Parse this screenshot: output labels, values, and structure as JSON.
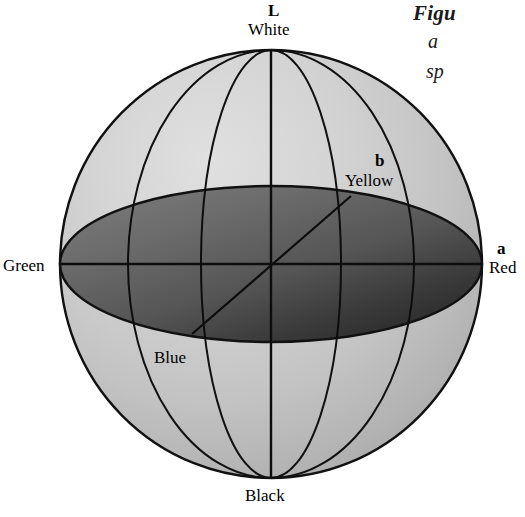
{
  "figure": {
    "type": "cielab-color-sphere-diagram",
    "caption": {
      "title": "Figu",
      "line2": "a",
      "line3": "sp"
    },
    "axes": [
      {
        "id": "L",
        "letter": "L",
        "pole_label": "White",
        "opposite_label": "Black",
        "orientation": "vertical"
      },
      {
        "id": "a",
        "letter": "a",
        "positive_label": "Red",
        "negative_label": "Green",
        "orientation": "horizontal"
      },
      {
        "id": "b",
        "letter": "b",
        "positive_label": "Yellow",
        "negative_label": "Blue",
        "orientation": "diagonal"
      }
    ],
    "labels": {
      "L": "L",
      "white": "White",
      "b": "b",
      "yellow": "Yellow",
      "a": "a",
      "red": "Red",
      "green": "Green",
      "blue": "Blue",
      "black": "Black"
    },
    "colors": {
      "sphere_light": "#d2d2d2",
      "sphere_mid": "#bdbdbd",
      "sphere_dark": "#9e9e9e",
      "equator_light": "#6e6e6e",
      "equator_mid": "#5a5a5a",
      "equator_dark": "#333333",
      "outline": "#111111",
      "background": "#ffffff",
      "text": "#000000"
    },
    "geometry": {
      "sphere_center_x": 271,
      "sphere_center_y": 264,
      "sphere_radius_x": 211,
      "sphere_radius_y": 214,
      "equator_semi_minor": 78,
      "meridian_narrow_semi_width": 70,
      "meridian_wide_semi_width": 143
    }
  }
}
